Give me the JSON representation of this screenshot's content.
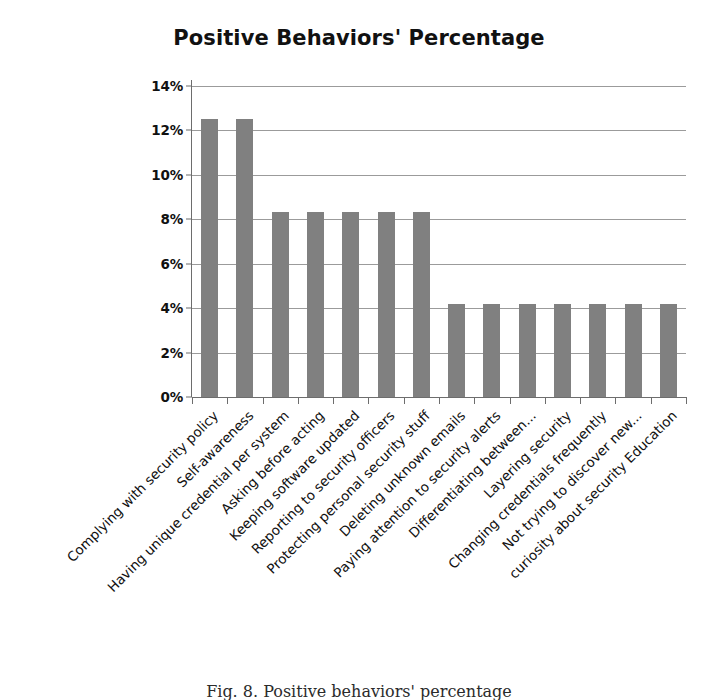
{
  "chart_data": {
    "type": "bar",
    "title": "Positive Behaviors' Percentage",
    "xlabel": "",
    "ylabel": "",
    "ylim": [
      0,
      14
    ],
    "ytick_labels": [
      "14%",
      "12%",
      "10%",
      "8%",
      "6%",
      "4%",
      "2%",
      "0%"
    ],
    "ytick_values": [
      14,
      12,
      10,
      8,
      6,
      4,
      2,
      0
    ],
    "grid": true,
    "legend": "none",
    "bar_color": "#808080",
    "categories": [
      "Complying with security policy",
      "Self-awareness",
      "Having unique credential per system",
      "Asking before acting",
      "Keeping software updated",
      "Reporting to security officers",
      "Protecting personal security stuff",
      "Deleting unknown emails",
      "Paying attention to security alerts",
      "Differentiating between...",
      "Layering security",
      "Changing credentials frequently",
      "Not trying to discover new...",
      "curiosity about security Education"
    ],
    "values": [
      12.5,
      12.5,
      8.35,
      8.35,
      8.35,
      8.35,
      8.35,
      4.2,
      4.2,
      4.2,
      4.2,
      4.2,
      4.2,
      4.2
    ],
    "value_labels": [
      "12.5%",
      "12.5%",
      "8.35%",
      "8.35%",
      "8.35%",
      "8.35%",
      "8.35%",
      "4.2%",
      "4.2%",
      "4.2%",
      "4.2%",
      "4.2%",
      "4.2%",
      "4.2%"
    ]
  },
  "caption": {
    "text": "Fig. 8. Positive behaviors' percentage"
  }
}
